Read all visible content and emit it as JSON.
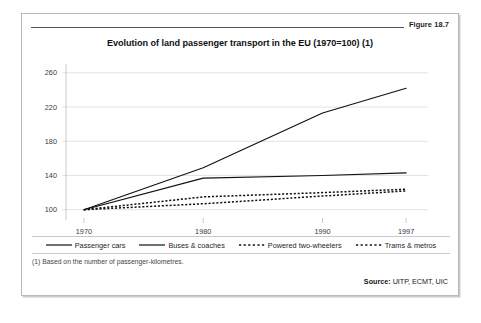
{
  "figure": {
    "number_label": "Figure 18.7",
    "title": "Evolution of land passenger transport in the EU (1970=100) (1)",
    "footnote": "(1) Based on the number of passenger-kilometres.",
    "source_prefix": "Source:",
    "source_text": "UITP, ECMT, UIC"
  },
  "chart_data": {
    "type": "line",
    "title": "Evolution of land passenger transport in the EU (1970=100) (1)",
    "xlabel": "",
    "ylabel": "",
    "x": [
      1970,
      1980,
      1990,
      1997
    ],
    "tick_labels_x": [
      "1970",
      "1980",
      "1990",
      "1997"
    ],
    "tick_labels_y": [
      "100",
      "140",
      "180",
      "220",
      "260"
    ],
    "yticks": [
      100,
      140,
      180,
      220,
      260
    ],
    "ylim": [
      88,
      268
    ],
    "xlim": [
      1968.5,
      1998.5
    ],
    "grid": true,
    "legend_position": "bottom",
    "series": [
      {
        "name": "Passenger cars",
        "style": "solid",
        "color": "#111113",
        "values": [
          100,
          149,
          213,
          242
        ]
      },
      {
        "name": "Buses & coaches",
        "style": "solid",
        "color": "#111113",
        "values": [
          100,
          137,
          140,
          143
        ]
      },
      {
        "name": "Powered two-wheelers",
        "style": "dashed",
        "color": "#111113",
        "values": [
          100,
          115,
          120,
          124
        ]
      },
      {
        "name": "Trams & metros",
        "style": "dashed",
        "color": "#111113",
        "values": [
          100,
          107,
          116,
          122
        ]
      }
    ]
  }
}
